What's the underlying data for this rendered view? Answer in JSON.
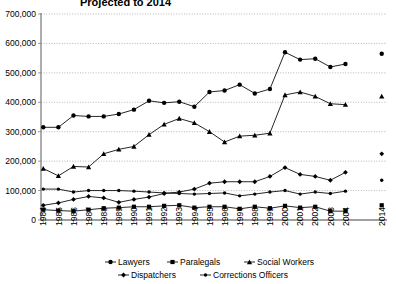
{
  "chart_data": {
    "type": "line",
    "title": "Projected to 2014",
    "xlabel": "",
    "ylabel": "",
    "ylim": [
      0,
      700000
    ],
    "ytick_values": [
      0,
      100000,
      200000,
      300000,
      400000,
      500000,
      600000,
      700000
    ],
    "ytick_labels": [
      "0",
      "100,000",
      "200,000",
      "300,000",
      "400,000",
      "500,000",
      "600,000",
      "700,000"
    ],
    "grid": true,
    "legend_position": "bottom",
    "categories": [
      "1984",
      "1985",
      "1986",
      "1987",
      "1988",
      "1989",
      "1990",
      "1991",
      "1992",
      "1993",
      "1994",
      "1995",
      "1996",
      "1997",
      "1998",
      "1999",
      "2000",
      "2001",
      "2002",
      "2003",
      "2004",
      "2014"
    ],
    "series": [
      {
        "name": "Lawyers",
        "marker": "circle",
        "values": [
          315000,
          315000,
          355000,
          352000,
          352000,
          360000,
          375000,
          405000,
          398000,
          402000,
          385000,
          435000,
          440000,
          460000,
          430000,
          445000,
          570000,
          545000,
          548000,
          520000,
          530000,
          565000
        ]
      },
      {
        "name": "Paralegals",
        "marker": "square",
        "values": [
          35000,
          32000,
          30000,
          35000,
          40000,
          42000,
          45000,
          45000,
          48000,
          50000,
          42000,
          45000,
          45000,
          38000,
          45000,
          40000,
          48000,
          42000,
          45000,
          30000,
          30000,
          50000
        ]
      },
      {
        "name": "Social Workers",
        "marker": "triangle",
        "values": [
          175000,
          150000,
          182000,
          180000,
          225000,
          240000,
          250000,
          290000,
          325000,
          345000,
          330000,
          300000,
          265000,
          285000,
          288000,
          295000,
          425000,
          435000,
          420000,
          395000,
          392000,
          420000
        ]
      },
      {
        "name": "Dispatchers",
        "marker": "diamond",
        "values": [
          50000,
          58000,
          70000,
          80000,
          75000,
          60000,
          70000,
          78000,
          90000,
          95000,
          105000,
          125000,
          130000,
          130000,
          130000,
          148000,
          178000,
          155000,
          148000,
          135000,
          162000,
          225000
        ]
      },
      {
        "name": "Corrections Officers",
        "marker": "dot",
        "values": [
          105000,
          105000,
          95000,
          100000,
          100000,
          100000,
          98000,
          95000,
          92000,
          90000,
          88000,
          90000,
          92000,
          82000,
          88000,
          95000,
          100000,
          88000,
          95000,
          90000,
          98000,
          135000
        ]
      }
    ],
    "legend": [
      "Lawyers",
      "Paralegals",
      "Social Workers",
      "Dispatchers",
      "Corrections Officers"
    ],
    "colors": {
      "series": "#000000",
      "grid": "#9a9a9a",
      "axis": "#808080",
      "background": "#ffffff"
    }
  }
}
